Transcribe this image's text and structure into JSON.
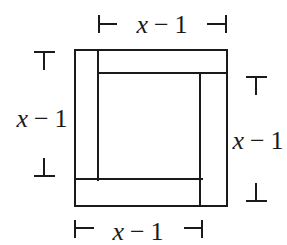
{
  "diagram": {
    "type": "square-with-four-strips",
    "labels": {
      "top": {
        "variable": "x",
        "operator": "−",
        "constant": "1"
      },
      "bottom": {
        "variable": "x",
        "operator": "−",
        "constant": "1"
      },
      "left": {
        "variable": "x",
        "operator": "−",
        "constant": "1"
      },
      "right": {
        "variable": "x",
        "operator": "−",
        "constant": "1"
      }
    },
    "colors": {
      "stroke": "#1a1a1a",
      "background": "#ffffff"
    }
  }
}
